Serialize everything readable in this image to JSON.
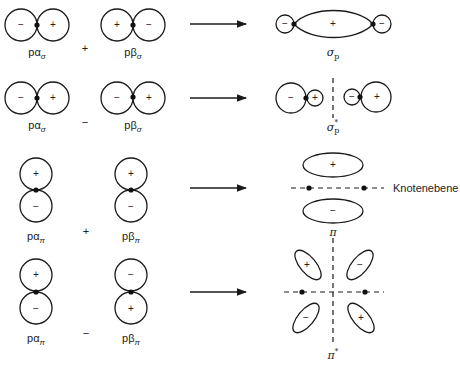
{
  "signs": {
    "plus": "+",
    "minus": "−"
  },
  "rows": [
    {
      "left_label": {
        "base": "pα",
        "sub": "σ"
      },
      "operator": "+",
      "right_label": {
        "base": "pβ",
        "sub": "σ"
      },
      "result_label": {
        "base": "σ",
        "sub": "p"
      }
    },
    {
      "left_label": {
        "base": "pα",
        "sub": "σ"
      },
      "operator": "−",
      "right_label": {
        "base": "pβ",
        "sub": "σ"
      },
      "result_label": {
        "base": "σ",
        "sub": "p",
        "sup": "*"
      }
    },
    {
      "left_label": {
        "base": "pα",
        "sub": "π"
      },
      "operator": "+",
      "right_label": {
        "base": "pβ",
        "sub": "π"
      },
      "result_label": {
        "base": "π"
      },
      "annotation": "Knotenebene"
    },
    {
      "left_label": {
        "base": "pα",
        "sub": "π"
      },
      "operator": "−",
      "right_label": {
        "base": "pβ",
        "sub": "π"
      },
      "result_label": {
        "base": "π",
        "sup": "*"
      }
    }
  ]
}
